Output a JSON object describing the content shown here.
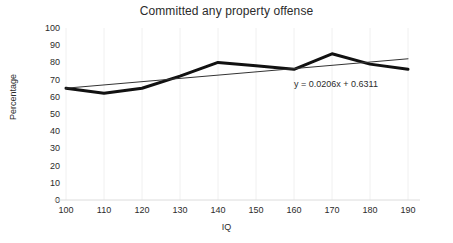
{
  "chart_data": {
    "type": "line",
    "title": "Committed any property offense",
    "xlabel": "IQ",
    "ylabel": "Percentage",
    "x": [
      100,
      110,
      120,
      130,
      140,
      150,
      160,
      170,
      180,
      190
    ],
    "xticklabels": [
      "100",
      "110",
      "120",
      "130",
      "140",
      "150",
      "160",
      "170",
      "180",
      "190"
    ],
    "yticklabels": [
      "100",
      "90",
      "80",
      "70",
      "60",
      "50",
      "40",
      "30",
      "20",
      "10",
      "0"
    ],
    "xlim": [
      100,
      190
    ],
    "ylim": [
      0,
      100
    ],
    "ytick_step": 10,
    "grid": "vertical-only",
    "legend": "none",
    "series": [
      {
        "name": "Committed any property offense",
        "kind": "data",
        "color": "#111111",
        "width": 3,
        "values": [
          65,
          62,
          65,
          72,
          80,
          78,
          76,
          85,
          79,
          76
        ]
      },
      {
        "name": "Linear trendline",
        "kind": "trendline",
        "color": "#333333",
        "width": 1,
        "values": [
          65.0,
          66.9,
          68.8,
          70.7,
          72.6,
          74.5,
          76.4,
          78.3,
          80.2,
          82.1
        ]
      }
    ],
    "annotations": [
      {
        "name": "trendline-equation",
        "text": "y = 0.0206x + 0.6311",
        "x": 160,
        "y": 67
      }
    ]
  },
  "style": {
    "background": "#ffffff",
    "gridline_color": "#f0f0f0",
    "text_color": "#2b2b2b",
    "data_color": "#111111",
    "trend_color": "#333333"
  }
}
